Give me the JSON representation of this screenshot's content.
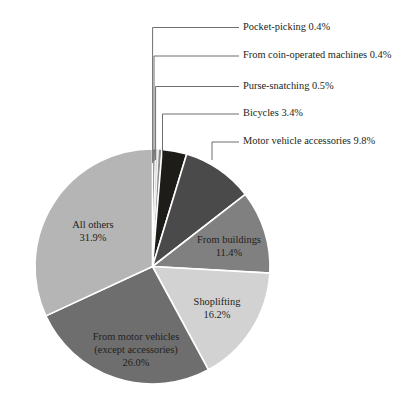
{
  "chart_data": {
    "type": "pie",
    "title": "",
    "subtitle": "",
    "xlabel": "",
    "ylabel": "",
    "legend_position": "none",
    "grid": false,
    "units": "percent",
    "total": 100.0,
    "start_angle_deg": 0,
    "direction": "clockwise",
    "categories": [
      "Pocket-picking",
      "From coin-operated machines",
      "Purse-snatching",
      "Bicycles",
      "Motor vehicle accessories",
      "From buildings",
      "Shoplifting",
      "From motor vehicles (except accessories)",
      "All others"
    ],
    "values": [
      0.4,
      0.4,
      0.5,
      3.4,
      9.8,
      11.4,
      16.2,
      26.0,
      31.9
    ],
    "value_labels": [
      "0.4%",
      "0.4%",
      "0.5%",
      "3.4%",
      "9.8%",
      "11.4%",
      "16.2%",
      "26.0%",
      "31.9%"
    ],
    "colors": [
      "#6f6f6f",
      "#d9d9d9",
      "#8c8c8c",
      "#1e1c18",
      "#4a4a4a",
      "#808080",
      "#d2d2d2",
      "#6e6e6e",
      "#b5b5b5"
    ],
    "slices": [
      {
        "label": "Pocket-picking",
        "value": 0.4,
        "value_label": "0.4%",
        "display": "Pocket-picking 0.4%",
        "color": "#6f6f6f",
        "label_placement": "callout"
      },
      {
        "label": "From coin-operated machines",
        "value": 0.4,
        "value_label": "0.4%",
        "display": "From coin-operated machines 0.4%",
        "color": "#d9d9d9",
        "label_placement": "callout"
      },
      {
        "label": "Purse-snatching",
        "value": 0.5,
        "value_label": "0.5%",
        "display": "Purse-snatching 0.5%",
        "color": "#8c8c8c",
        "label_placement": "callout"
      },
      {
        "label": "Bicycles",
        "value": 3.4,
        "value_label": "3.4%",
        "display": "Bicycles 3.4%",
        "color": "#1e1c18",
        "label_placement": "callout"
      },
      {
        "label": "Motor vehicle accessories",
        "value": 9.8,
        "value_label": "9.8%",
        "display": "Motor vehicle accessories 9.8%",
        "color": "#4a4a4a",
        "label_placement": "callout"
      },
      {
        "label": "From buildings",
        "value": 11.4,
        "value_label": "11.4%",
        "display": "From buildings 11.4%",
        "color": "#808080",
        "label_placement": "inside"
      },
      {
        "label": "Shoplifting",
        "value": 16.2,
        "value_label": "16.2%",
        "display": "Shoplifting 16.2%",
        "color": "#d2d2d2",
        "label_placement": "inside"
      },
      {
        "label": "From motor vehicles (except accessories)",
        "value": 26.0,
        "value_label": "26.0%",
        "display": "From motor vehicles (except accessories) 26.0%",
        "color": "#6e6e6e",
        "label_placement": "inside"
      },
      {
        "label": "All others",
        "value": 31.9,
        "value_label": "31.9%",
        "display": "All others 31.9%",
        "color": "#b5b5b5",
        "label_placement": "inside"
      }
    ]
  },
  "callouts": {
    "pocket_picking": "Pocket-picking 0.4%",
    "coin_operated": "From coin-operated machines 0.4%",
    "purse_snatching": "Purse-snatching 0.5%",
    "bicycles": "Bicycles 3.4%",
    "motor_vehicle_accessories": "Motor vehicle accessories 9.8%"
  },
  "inner_labels": {
    "all_others_name": "All others",
    "all_others_value": "31.9%",
    "from_buildings_name": "From buildings",
    "from_buildings_value": "11.4%",
    "shoplifting_name": "Shoplifting",
    "shoplifting_value": "16.2%",
    "motor_vehicles_line1": "From motor vehicles",
    "motor_vehicles_line2": "(except accessories)",
    "motor_vehicles_value": "26.0%"
  },
  "style": {
    "background": "#ffffff",
    "separator": "#ffffff",
    "leader": "#5d5d5d",
    "text": "#231f20"
  }
}
